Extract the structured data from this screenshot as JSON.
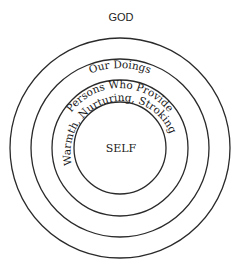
{
  "diagram": {
    "title": "GOD",
    "center_label": "SELF",
    "rings": [
      {
        "label": "Our Doings",
        "radius": 110
      },
      {
        "label": "Persons Who Provide",
        "radius": 89
      },
      {
        "label": "Warmth, Nurturing, Stroking",
        "radius": 68
      },
      {
        "label": "",
        "radius": 46
      }
    ]
  },
  "colors": {
    "stroke": "#2a2a2a",
    "text": "#1a1a1a",
    "background": "#ffffff"
  }
}
